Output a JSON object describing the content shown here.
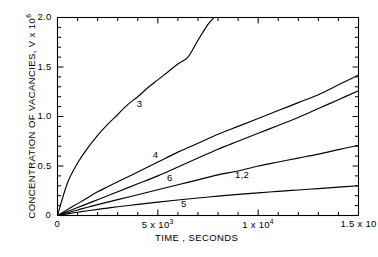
{
  "chart_data": {
    "type": "line",
    "title": "",
    "xlabel": "TIME , SECONDS",
    "ylabel_prefix": "CONCENTRATION OF VACANCIES, V x 10",
    "ylabel_exponent": "6",
    "xlim": [
      0,
      15000
    ],
    "ylim": [
      0,
      2.0
    ],
    "grid": false,
    "legend": "inline-curve-labels",
    "x_tick_labels": [
      {
        "value": 0,
        "text": "0"
      },
      {
        "value": 5000,
        "text": "5 x 10",
        "exponent": "3"
      },
      {
        "value": 10000,
        "text": "1 x 10",
        "exponent": "4"
      },
      {
        "value": 15000,
        "text": "1.5 x 10",
        "exponent": ""
      }
    ],
    "y_tick_labels": [
      {
        "value": 0,
        "text": "0"
      },
      {
        "value": 0.5,
        "text": "0.5"
      },
      {
        "value": 1.0,
        "text": "1.0"
      },
      {
        "value": 1.5,
        "text": "1.5"
      },
      {
        "value": 2.0,
        "text": "2.0"
      }
    ],
    "x_minor_tick_step": 1000,
    "y_minor_tick_step": 0.1,
    "series": [
      {
        "name": "3",
        "label": "3",
        "label_x": 4200,
        "label_y": 1.13,
        "x": [
          0,
          500,
          1000,
          1500,
          2000,
          2500,
          3000,
          3500,
          4000,
          4500,
          5000,
          5500,
          6000,
          6500,
          7000,
          7500,
          7800
        ],
        "y": [
          0,
          0.33,
          0.53,
          0.68,
          0.81,
          0.92,
          1.02,
          1.12,
          1.2,
          1.29,
          1.37,
          1.45,
          1.53,
          1.6,
          1.77,
          1.93,
          2.0
        ]
      },
      {
        "name": "4",
        "label": "4",
        "label_x": 5000,
        "label_y": 0.61,
        "x": [
          0,
          500,
          1000,
          1500,
          2000,
          2500,
          3000,
          4000,
          5000,
          6000,
          7000,
          8000,
          9000,
          10000,
          11000,
          12000,
          13000,
          14000,
          15000
        ],
        "y": [
          0,
          0.06,
          0.12,
          0.18,
          0.24,
          0.29,
          0.34,
          0.44,
          0.54,
          0.64,
          0.73,
          0.82,
          0.9,
          0.98,
          1.06,
          1.14,
          1.22,
          1.32,
          1.42
        ]
      },
      {
        "name": "6",
        "label": "6",
        "label_x": 5700,
        "label_y": 0.38,
        "x": [
          0,
          500,
          1000,
          1500,
          2000,
          2500,
          3000,
          4000,
          5000,
          6000,
          7000,
          8000,
          9000,
          10000,
          11000,
          12000,
          13000,
          14000,
          15000
        ],
        "y": [
          0,
          0.04,
          0.08,
          0.12,
          0.16,
          0.2,
          0.24,
          0.32,
          0.4,
          0.49,
          0.58,
          0.67,
          0.75,
          0.83,
          0.91,
          0.99,
          1.08,
          1.17,
          1.26
        ]
      },
      {
        "name": "1,2",
        "label": "1,2",
        "label_x": 9100,
        "label_y": 0.41,
        "x": [
          0,
          500,
          1000,
          1500,
          2000,
          2500,
          3000,
          4000,
          5000,
          6000,
          7000,
          8000,
          9000,
          10000,
          11000,
          12000,
          13000,
          14000,
          15000
        ],
        "y": [
          0,
          0.028,
          0.056,
          0.083,
          0.11,
          0.135,
          0.16,
          0.21,
          0.26,
          0.31,
          0.36,
          0.41,
          0.45,
          0.5,
          0.54,
          0.58,
          0.62,
          0.665,
          0.71
        ]
      },
      {
        "name": "5",
        "label": "5",
        "label_x": 6400,
        "label_y": 0.12,
        "x": [
          0,
          500,
          1000,
          1500,
          2000,
          2500,
          3000,
          4000,
          5000,
          6000,
          7000,
          8000,
          9000,
          10000,
          11000,
          12000,
          13000,
          14000,
          15000
        ],
        "y": [
          0,
          0.017,
          0.033,
          0.048,
          0.062,
          0.075,
          0.088,
          0.112,
          0.135,
          0.157,
          0.177,
          0.196,
          0.213,
          0.229,
          0.244,
          0.258,
          0.272,
          0.286,
          0.3
        ]
      }
    ]
  },
  "colors": {
    "line": "#000000",
    "axis": "#000000",
    "background": "#ffffff"
  }
}
